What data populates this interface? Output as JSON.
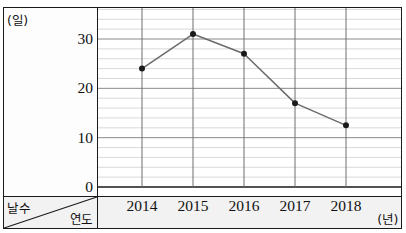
{
  "chart_data": {
    "type": "line",
    "title": "",
    "subtitle": "",
    "xlabel": "연도",
    "ylabel": "날수",
    "x_unit": "(년)",
    "y_unit": "(일)",
    "categories": [
      "2014",
      "2015",
      "2016",
      "2017",
      "2018"
    ],
    "values": [
      24,
      31,
      27,
      17,
      12.5
    ],
    "series": [
      {
        "name": "날수",
        "values": [
          24,
          31,
          27,
          17,
          12.5
        ]
      }
    ],
    "xlim": [
      2013.5,
      2018.5
    ],
    "ylim": [
      0,
      36
    ],
    "ytick_labels": [
      "0",
      "10",
      "20",
      "30"
    ],
    "ytick_values": [
      0,
      10,
      20,
      30
    ],
    "minor_tick_step": 2,
    "grid": true,
    "grid_major_color": "#8a8a8a",
    "grid_minor_color": "#cfcfcf",
    "line_color": "#6b6b6b",
    "marker_color": "#1a1a1a",
    "legend": "none",
    "legend_position": "none"
  },
  "corner": {
    "upper_label": "날수",
    "lower_label": "연도"
  },
  "axes": {
    "y_unit_label": "(일)",
    "x_unit_label": "(년)"
  }
}
